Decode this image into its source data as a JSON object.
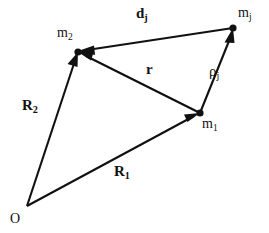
{
  "figure": {
    "type": "vector-diagram",
    "background_color": "#ffffff",
    "stroke_color": "#111111",
    "width": 269,
    "height": 233
  },
  "points": {
    "origin": {
      "label": "O",
      "x": 27,
      "y": 206,
      "has_dot": false
    },
    "m1": {
      "label_base": "m",
      "label_sub": "1",
      "x": 200,
      "y": 113,
      "has_dot": true
    },
    "m2": {
      "label_base": "m",
      "label_sub": "2",
      "x": 78,
      "y": 52,
      "has_dot": true
    },
    "mj": {
      "label_base": "m",
      "label_sub": "j",
      "x": 233,
      "y": 28,
      "has_dot": true
    }
  },
  "vectors": [
    {
      "name": "R1",
      "label_base": "R",
      "label_sub": "1",
      "bold": true,
      "from": "origin",
      "to": "m1",
      "x1": 27,
      "y1": 206,
      "x2": 200,
      "y2": 113,
      "arrow_at": "end"
    },
    {
      "name": "R2",
      "label_base": "R",
      "label_sub": "2",
      "bold": true,
      "from": "origin",
      "to": "m2",
      "x1": 27,
      "y1": 206,
      "x2": 78,
      "y2": 52,
      "arrow_at": "end"
    },
    {
      "name": "r",
      "label_base": "r",
      "label_sub": "",
      "bold": true,
      "from": "m1",
      "to": "m2",
      "x1": 200,
      "y1": 113,
      "x2": 78,
      "y2": 52,
      "arrow_at": "end"
    },
    {
      "name": "rho_j",
      "label_base": "ρ",
      "label_sub": "j",
      "bold": false,
      "from": "m1",
      "to": "mj",
      "x1": 200,
      "y1": 113,
      "x2": 233,
      "y2": 28,
      "arrow_at": "end"
    },
    {
      "name": "d_j",
      "label_base": "d",
      "label_sub": "j",
      "bold": true,
      "from": "mj",
      "to": "m2",
      "x1": 233,
      "y1": 28,
      "x2": 78,
      "y2": 52,
      "arrow_at": "end"
    }
  ],
  "labels": {
    "dj": {
      "base": "d",
      "sub": "j"
    },
    "mj": {
      "base": "m",
      "sub": "j"
    },
    "m2": {
      "base": "m",
      "sub": "2"
    },
    "m1": {
      "base": "m",
      "sub": "1"
    },
    "r": {
      "base": "r",
      "sub": ""
    },
    "rhoj": {
      "base": "ρ",
      "sub": "j"
    },
    "R2": {
      "base": "R",
      "sub": "2"
    },
    "R1": {
      "base": "R",
      "sub": "1"
    },
    "O": {
      "base": "O",
      "sub": ""
    }
  }
}
